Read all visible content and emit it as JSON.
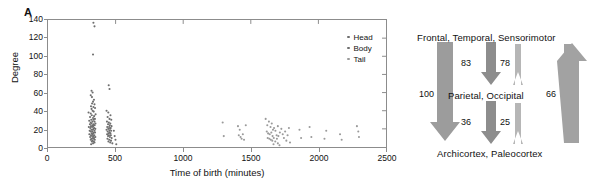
{
  "figure": {
    "panels": [
      {
        "letter": "A"
      },
      {
        "letter": "B"
      }
    ]
  },
  "panel_a": {
    "letter": "A",
    "legend": {
      "items": [
        {
          "label": "Head",
          "color": "#6e6e6e"
        },
        {
          "label": "Body",
          "color": "#6e6e6e"
        },
        {
          "label": "Tail",
          "color": "#9a9a9a"
        }
      ]
    }
  },
  "panel_b": {
    "letter": "B",
    "nodes": {
      "top": "Frontal, Temporal, Sensorimotor",
      "middle": "Parietal, Occipital",
      "bottom": "Archicortex, Paleocortex"
    },
    "edges": [
      {
        "id": "top-to-bottom-left",
        "value": "100",
        "direction": "down",
        "color": "#9a9a9a"
      },
      {
        "id": "top-to-middle",
        "value": "83",
        "direction": "down",
        "color": "#8a8a8a"
      },
      {
        "id": "middle-to-top",
        "value": "78",
        "direction": "up",
        "color": "#b4b4b4"
      },
      {
        "id": "middle-to-bottom",
        "value": "36",
        "direction": "down",
        "color": "#8a8a8a"
      },
      {
        "id": "bottom-to-middle",
        "value": "25",
        "direction": "up",
        "color": "#b4b4b4"
      },
      {
        "id": "bottom-to-top-right",
        "value": "66",
        "direction": "up",
        "color": "#9a9a9a"
      }
    ]
  },
  "chart_data": {
    "type": "scatter",
    "title": "",
    "xlabel": "Time of birth (minutes)",
    "ylabel": "Degree",
    "xlim": [
      0,
      2500
    ],
    "ylim": [
      0,
      140
    ],
    "xticks": [
      0,
      500,
      1000,
      1500,
      2000,
      2500
    ],
    "yticks": [
      0,
      20,
      40,
      60,
      80,
      100,
      120,
      140
    ],
    "grid": false,
    "legend_position": "upper-right",
    "series": [
      {
        "name": "Head",
        "color": "#6e6e6e",
        "points": [
          [
            336,
            137
          ],
          [
            344,
            133
          ],
          [
            333,
            102
          ],
          [
            322,
            62
          ],
          [
            330,
            60
          ],
          [
            316,
            57
          ],
          [
            325,
            55
          ],
          [
            340,
            52
          ],
          [
            333,
            50
          ],
          [
            326,
            48
          ],
          [
            344,
            47
          ],
          [
            318,
            45
          ],
          [
            336,
            44
          ],
          [
            348,
            43
          ],
          [
            322,
            42
          ],
          [
            300,
            38
          ],
          [
            330,
            40
          ],
          [
            338,
            39
          ],
          [
            316,
            37
          ],
          [
            352,
            36
          ],
          [
            324,
            35
          ],
          [
            341,
            34
          ],
          [
            311,
            33
          ],
          [
            333,
            32
          ],
          [
            347,
            31
          ],
          [
            320,
            30
          ],
          [
            336,
            30
          ],
          [
            305,
            29
          ],
          [
            329,
            28
          ],
          [
            344,
            28
          ],
          [
            316,
            27
          ],
          [
            351,
            26
          ],
          [
            322,
            26
          ],
          [
            338,
            25
          ],
          [
            310,
            25
          ],
          [
            330,
            24
          ],
          [
            345,
            24
          ],
          [
            318,
            23
          ],
          [
            334,
            23
          ],
          [
            302,
            22
          ],
          [
            326,
            22
          ],
          [
            341,
            21
          ],
          [
            313,
            21
          ],
          [
            337,
            20
          ],
          [
            350,
            20
          ],
          [
            321,
            19
          ],
          [
            332,
            19
          ],
          [
            308,
            18
          ],
          [
            344,
            18
          ],
          [
            327,
            17
          ],
          [
            316,
            17
          ],
          [
            339,
            16
          ],
          [
            348,
            16
          ],
          [
            323,
            15
          ],
          [
            334,
            15
          ],
          [
            306,
            14
          ],
          [
            330,
            14
          ],
          [
            343,
            13
          ],
          [
            318,
            13
          ],
          [
            337,
            12
          ],
          [
            326,
            12
          ],
          [
            350,
            11
          ],
          [
            312,
            11
          ],
          [
            332,
            10
          ],
          [
            341,
            10
          ],
          [
            321,
            9
          ],
          [
            335,
            9
          ],
          [
            346,
            8
          ],
          [
            316,
            8
          ],
          [
            329,
            7
          ],
          [
            339,
            6
          ],
          [
            324,
            6
          ],
          [
            344,
            5
          ],
          [
            333,
            4
          ],
          [
            319,
            3
          ]
        ]
      },
      {
        "name": "Body",
        "color": "#6e6e6e",
        "points": [
          [
            449,
            68
          ],
          [
            455,
            64
          ],
          [
            433,
            40
          ],
          [
            446,
            38
          ],
          [
            462,
            35
          ],
          [
            441,
            33
          ],
          [
            455,
            31
          ],
          [
            468,
            30
          ],
          [
            436,
            28
          ],
          [
            450,
            27
          ],
          [
            461,
            26
          ],
          [
            444,
            25
          ],
          [
            457,
            24
          ],
          [
            470,
            23
          ],
          [
            438,
            22
          ],
          [
            452,
            22
          ],
          [
            464,
            21
          ],
          [
            446,
            20
          ],
          [
            459,
            20
          ],
          [
            433,
            19
          ],
          [
            454,
            18
          ],
          [
            467,
            18
          ],
          [
            441,
            17
          ],
          [
            456,
            16
          ],
          [
            448,
            15
          ],
          [
            462,
            15
          ],
          [
            437,
            14
          ],
          [
            451,
            13
          ],
          [
            465,
            13
          ],
          [
            444,
            12
          ],
          [
            458,
            11
          ],
          [
            471,
            10
          ],
          [
            440,
            9
          ],
          [
            453,
            8
          ],
          [
            466,
            7
          ],
          [
            447,
            6
          ],
          [
            460,
            5
          ],
          [
            476,
            4
          ],
          [
            487,
            18
          ],
          [
            493,
            12
          ],
          [
            499,
            8
          ],
          [
            505,
            3
          ]
        ]
      },
      {
        "name": "Tail",
        "color": "#9a9a9a",
        "points": [
          [
            1292,
            27
          ],
          [
            1300,
            12
          ],
          [
            1405,
            23
          ],
          [
            1418,
            19
          ],
          [
            1411,
            13
          ],
          [
            1424,
            11
          ],
          [
            1432,
            9
          ],
          [
            1441,
            14
          ],
          [
            1450,
            8
          ],
          [
            1463,
            24
          ],
          [
            1610,
            31
          ],
          [
            1622,
            24
          ],
          [
            1634,
            28
          ],
          [
            1646,
            22
          ],
          [
            1655,
            26
          ],
          [
            1664,
            19
          ],
          [
            1618,
            17
          ],
          [
            1628,
            15
          ],
          [
            1640,
            14
          ],
          [
            1652,
            16
          ],
          [
            1661,
            12
          ],
          [
            1672,
            21
          ],
          [
            1682,
            18
          ],
          [
            1691,
            13
          ],
          [
            1700,
            23
          ],
          [
            1625,
            10
          ],
          [
            1637,
            9
          ],
          [
            1648,
            8
          ],
          [
            1659,
            7
          ],
          [
            1670,
            10
          ],
          [
            1681,
            6
          ],
          [
            1693,
            9
          ],
          [
            1704,
            12
          ],
          [
            1715,
            16
          ],
          [
            1726,
            20
          ],
          [
            1736,
            14
          ],
          [
            1745,
            10
          ],
          [
            1754,
            17
          ],
          [
            1763,
            7
          ],
          [
            1772,
            13
          ],
          [
            1782,
            21
          ],
          [
            1790,
            5
          ],
          [
            1700,
            4
          ],
          [
            1668,
            3
          ],
          [
            1712,
            2
          ],
          [
            1860,
            19
          ],
          [
            1872,
            10
          ],
          [
            1935,
            22
          ],
          [
            1948,
            11
          ],
          [
            2045,
            9
          ],
          [
            2058,
            18
          ],
          [
            2160,
            14
          ],
          [
            2172,
            8
          ],
          [
            2285,
            23
          ],
          [
            2295,
            17
          ],
          [
            2300,
            11
          ]
        ]
      }
    ]
  }
}
